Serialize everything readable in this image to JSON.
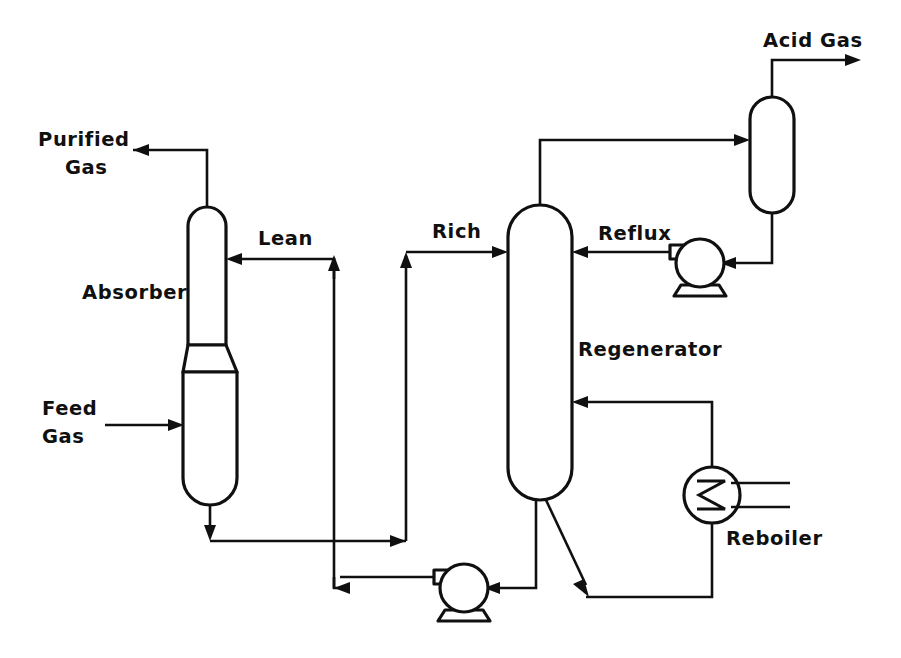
{
  "diagram": {
    "type": "process-flow-diagram",
    "background_color": "#ffffff",
    "line_color": "#101010",
    "canvas": {
      "width": 901,
      "height": 658
    }
  },
  "labels": {
    "purified_gas_line1": "Purified",
    "purified_gas_line2": "Gas",
    "feed_gas_line1": "Feed",
    "feed_gas_line2": "Gas",
    "absorber": "Absorber",
    "lean": "Lean",
    "rich": "Rich",
    "regenerator": "Regenerator",
    "reflux": "Reflux",
    "acid_gas": "Acid Gas",
    "reboiler": "Reboiler"
  },
  "equipment": [
    {
      "name": "absorber",
      "label": "Absorber",
      "kind": "column",
      "note": "narrow top section over wider bottom section with tapered transition"
    },
    {
      "name": "regenerator",
      "label": "Regenerator",
      "kind": "column",
      "note": "single tall vertical vessel with rounded heads"
    },
    {
      "name": "reflux-drum",
      "label": "",
      "kind": "drum",
      "note": "vertical rounded drum at top right"
    },
    {
      "name": "reflux-pump",
      "label": "",
      "kind": "pump",
      "note": "centrifugal pump circle on trapezoid base"
    },
    {
      "name": "lean-solvent-pump",
      "label": "",
      "kind": "pump",
      "note": "centrifugal pump circle on trapezoid base"
    },
    {
      "name": "reboiler",
      "label": "Reboiler",
      "kind": "heat-exchanger",
      "note": "circle with internal zigzag coil and two steam lines"
    }
  ],
  "streams": [
    {
      "name": "purified-gas",
      "label": "Purified Gas",
      "from": "absorber-top",
      "to": "outlet-left"
    },
    {
      "name": "feed-gas",
      "label": "Feed Gas",
      "from": "inlet-left",
      "to": "absorber-lower"
    },
    {
      "name": "lean-solvent",
      "label": "Lean",
      "from": "lean-pump",
      "to": "absorber-top-section"
    },
    {
      "name": "rich-solvent",
      "label": "Rich",
      "from": "absorber-bottom",
      "to": "regenerator-upper"
    },
    {
      "name": "acid-gas",
      "label": "Acid Gas",
      "from": "reflux-drum-top",
      "to": "outlet-right"
    },
    {
      "name": "reflux",
      "label": "Reflux",
      "from": "reflux-pump",
      "to": "regenerator-upper"
    },
    {
      "name": "overhead-vapor",
      "label": "",
      "from": "regenerator-top",
      "to": "reflux-drum"
    },
    {
      "name": "reboiler-vapor-return",
      "label": "",
      "from": "reboiler",
      "to": "regenerator-lower"
    },
    {
      "name": "reboiler-liquid-feed",
      "label": "",
      "from": "regenerator-bottom",
      "to": "reboiler-loop"
    },
    {
      "name": "lean-solvent-return",
      "label": "",
      "from": "regenerator-bottom",
      "to": "lean-pump"
    }
  ]
}
